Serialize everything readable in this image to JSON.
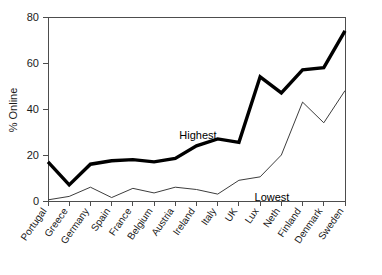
{
  "chart_data": {
    "type": "line",
    "title": "",
    "xlabel": "",
    "ylabel": "% Online",
    "ylim": [
      0,
      80
    ],
    "yticks": [
      0,
      20,
      40,
      60,
      80
    ],
    "grid": false,
    "legend_position": "inline-annotation",
    "categories": [
      "Portugal",
      "Greece",
      "Germany",
      "Spain",
      "France",
      "Belgium",
      "Austria",
      "Ireland",
      "Italy",
      "UK",
      "Lux",
      "Neth",
      "Finland",
      "Denmark",
      "Sweden"
    ],
    "series": [
      {
        "name": "Highest",
        "values": [
          17,
          7,
          16,
          17.5,
          18,
          17,
          18.5,
          24,
          27,
          25.5,
          54,
          47,
          57,
          58,
          74
        ]
      },
      {
        "name": "Lowest",
        "values": [
          0.5,
          2,
          6,
          1.5,
          5.5,
          3.5,
          6,
          5,
          3,
          9,
          10.5,
          20,
          43,
          34,
          48
        ]
      }
    ],
    "annotations": [
      {
        "text": "Highest",
        "series": "Highest",
        "x_px": 198,
        "y_px": 139
      },
      {
        "text": "Lowest",
        "series": "Lowest",
        "x_px": 272,
        "y_px": 201
      }
    ]
  },
  "axis": {
    "y_tick_labels": [
      "80",
      "60",
      "40",
      "20",
      "0"
    ],
    "y_axis_title": "% Online"
  },
  "colors": {
    "highest_line": "#000000",
    "lowest_line": "#3d3d3d",
    "axis": "#4d4d4d",
    "text": "#1a1a1a",
    "background": "#ffffff"
  }
}
